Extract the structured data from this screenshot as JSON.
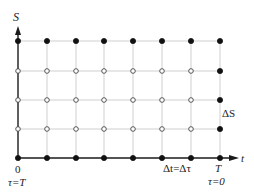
{
  "diagram": {
    "axes": {
      "y_label": "S",
      "x_label": "t",
      "origin_label": "0",
      "origin_tau_label": "τ=T",
      "end_label": "T",
      "end_tau_label": "τ=0",
      "dt_label": "Δt=Δτ",
      "ds_label": "ΔS"
    },
    "grid": {
      "columns_x": [
        18,
        47,
        76,
        104,
        133,
        162,
        191,
        220
      ],
      "rows_y": [
        41,
        71,
        100,
        129,
        158
      ],
      "row_point_types": [
        [
          "filled",
          "filled",
          "filled",
          "filled",
          "filled",
          "filled",
          "filled",
          "filled"
        ],
        [
          "open",
          "open",
          "open",
          "open",
          "open",
          "open",
          "open",
          "filled"
        ],
        [
          "open",
          "open",
          "open",
          "open",
          "open",
          "open",
          "open",
          "filled"
        ],
        [
          "open",
          "open",
          "open",
          "open",
          "open",
          "open",
          "open",
          "filled"
        ],
        [
          "filled",
          "filled",
          "filled",
          "filled",
          "filled",
          "filled",
          "filled",
          "filled"
        ]
      ]
    },
    "colors": {
      "grid": "#cfcfcf",
      "axis": "#1a1a1a",
      "filled_point": "#111111",
      "open_point_stroke": "#444444"
    }
  }
}
